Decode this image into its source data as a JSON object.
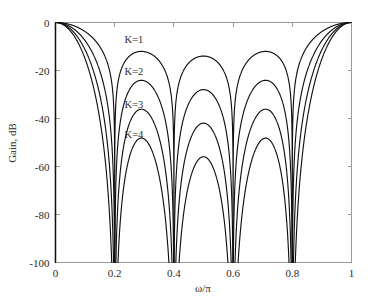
{
  "chart_data": {
    "type": "line",
    "title": "",
    "xlabel": "ω/π",
    "ylabel": "Gain, dB",
    "xlim": [
      0,
      1
    ],
    "ylim": [
      -100,
      0
    ],
    "grid": false,
    "legend_position": "inline-annotations",
    "x_ticks": [
      "0",
      "0.2",
      "0.4",
      "0.6",
      "0.8",
      "1"
    ],
    "x_tick_values": [
      0,
      0.2,
      0.4,
      0.6,
      0.8,
      1
    ],
    "y_ticks": [
      "0",
      "-20",
      "-40",
      "-60",
      "-80",
      "-100"
    ],
    "y_tick_values": [
      0,
      -20,
      -40,
      -60,
      -80,
      -100
    ],
    "function": "20*K*log10(|sin(5*pi*x)/(5*sin(pi*x))|)",
    "nulls_x": [
      0.2,
      0.4,
      0.6,
      0.8
    ],
    "series": [
      {
        "name": "K=1",
        "K": 1,
        "label": "K=1",
        "label_x": 0.265,
        "label_y": -8.5,
        "sidelobe_peaks_x": [
          0.29,
          0.49,
          0.7,
          0.9
        ],
        "sidelobe_peaks_db": [
          -13.3,
          -17.8,
          -19.3,
          -20.0
        ]
      },
      {
        "name": "K=2",
        "K": 2,
        "label": "K=2",
        "label_x": 0.265,
        "label_y": -22.0,
        "sidelobe_peaks_x": [
          0.29,
          0.49,
          0.7,
          0.9
        ],
        "sidelobe_peaks_db": [
          -26.6,
          -35.6,
          -38.6,
          -40.0
        ]
      },
      {
        "name": "K=3",
        "K": 3,
        "label": "K=3",
        "label_x": 0.265,
        "label_y": -35.5,
        "sidelobe_peaks_x": [
          0.29,
          0.49,
          0.7,
          0.9
        ],
        "sidelobe_peaks_db": [
          -39.9,
          -53.4,
          -57.9,
          -60.0
        ]
      },
      {
        "name": "K=4",
        "K": 4,
        "label": "K=4",
        "label_x": 0.265,
        "label_y": -48.0,
        "sidelobe_peaks_x": [
          0.29,
          0.49,
          0.7,
          0.9
        ],
        "sidelobe_peaks_db": [
          -53.2,
          -71.2,
          -77.2,
          -80.0
        ]
      }
    ]
  },
  "axes": {
    "y_axis_title": "Gain, dB",
    "x_axis_title": "ω/π"
  },
  "colors": {
    "curve": "#111111",
    "frame": "#9a9a9a",
    "text": "#2b2b2b",
    "background": "#ffffff"
  }
}
